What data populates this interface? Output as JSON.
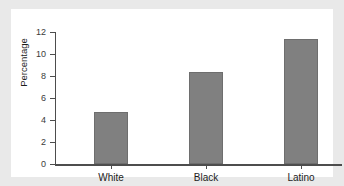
{
  "chart_data": {
    "type": "bar",
    "title": "",
    "subtitle": "",
    "xlabel": "",
    "ylabel": "Percentage",
    "categories": [
      "White",
      "Black",
      "Latino"
    ],
    "values": [
      4.7,
      8.4,
      11.4
    ],
    "ylim": [
      0,
      12
    ],
    "yticks": [
      0,
      2,
      4,
      6,
      8,
      10,
      12
    ],
    "ytick_labels": [
      "0",
      "2",
      "4",
      "6",
      "8",
      "10",
      "12"
    ],
    "grid": false,
    "legend": null,
    "bar_color": "#808080",
    "bar_edge_color": "#6e6e6e",
    "axis_color": "#4d4d4d",
    "panel_background": "#ffffff",
    "figure_background": "#e9e9e9"
  },
  "axis": {
    "y_label": "Percentage",
    "tick_0": "0",
    "tick_2": "2",
    "tick_4": "4",
    "tick_6": "6",
    "tick_8": "8",
    "tick_10": "10",
    "tick_12": "12"
  },
  "categories": {
    "white": "White",
    "black": "Black",
    "latino": "Latino"
  }
}
